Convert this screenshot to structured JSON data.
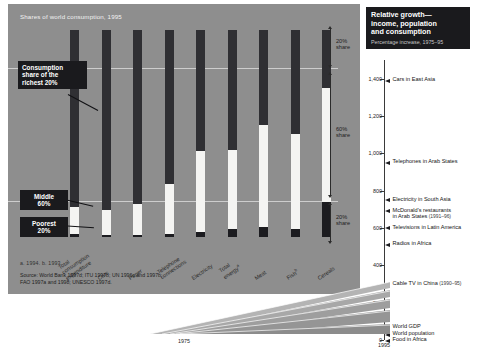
{
  "left_panel": {
    "title": "Shares of world consumption, 1995",
    "callouts": [
      {
        "id": "richest",
        "text": "Consumption\nshare of the\nrichest 20%"
      },
      {
        "id": "middle",
        "text": "Middle\n60%"
      },
      {
        "id": "poorest",
        "text": "Poorest\n20%"
      }
    ],
    "brackets": [
      {
        "label": "20%\nshare"
      },
      {
        "label": "60%\nshare"
      },
      {
        "label": "20%\nshare"
      }
    ],
    "footnote": "a. 1994.   b. 1993.",
    "source": "Source: World Bank 1997d; ITU 1997b; UN 1996c and 1997b;\nFAO 1997a and 1998; UNESCO 1997d.",
    "base_year": "1975"
  },
  "right_panel": {
    "title": "Relative growth—\nincome, population\nand consumption",
    "subtitle": "Percentage increase, 1975–95",
    "axis_ticks": [
      "1,400",
      "1,200",
      "1,000",
      "800",
      "600",
      "400",
      "200",
      "0"
    ],
    "base_year": "1995",
    "items": [
      {
        "label": "Cars in East Asia",
        "note": "",
        "value": 1400
      },
      {
        "label": "Telephones in Arab States",
        "note": "",
        "value": 960
      },
      {
        "label": "Electricity in South Asia",
        "note": "",
        "value": 760
      },
      {
        "label": "McDonald's restaurants",
        "label2": "in Arab States",
        "note": "(1991–96)",
        "value": 700
      },
      {
        "label": "Televisions in Latin America",
        "note": "",
        "value": 610
      },
      {
        "label": "Radios in Africa",
        "note": "",
        "value": 520
      },
      {
        "label": "Cable TV in China",
        "note": "(1990–95)",
        "value": 310
      },
      {
        "label": "World GDP",
        "note": "",
        "value": 75
      },
      {
        "label": "World population",
        "note": "",
        "value": 40
      },
      {
        "label": "Food in Africa",
        "note": "",
        "value": 5
      }
    ]
  },
  "chart_data": {
    "type": "bar",
    "title": "Shares of world consumption, 1995",
    "xlabel": "",
    "ylabel": "Share of world consumption (%)",
    "ylim": [
      0,
      100
    ],
    "grid": true,
    "legend_position": "right-bracket",
    "categories": [
      "Total consumption expenditure",
      "Cars",
      "Paper",
      "Telephone connections",
      "Electricity",
      "Total energy",
      "Meat",
      "Fish",
      "Cereals"
    ],
    "category_footnotes": [
      "",
      "",
      "",
      "",
      "",
      "a",
      "",
      "b",
      ""
    ],
    "series": [
      {
        "name": "Richest 20%",
        "color": "#2f2f33",
        "values": [
          86,
          87,
          84,
          74,
          58,
          58,
          45,
          45,
          28
        ]
      },
      {
        "name": "Middle 60%",
        "color": "#f4f4f2",
        "values": [
          13,
          12,
          15,
          24,
          39,
          38,
          49,
          46,
          55
        ]
      },
      {
        "name": "Poorest 20%",
        "color": "#1c1c20",
        "values": [
          1.3,
          1.1,
          1.1,
          1.5,
          2.5,
          4,
          5,
          4,
          17
        ]
      }
    ],
    "annotations": [
      "Consumption share of the richest 20%",
      "Middle 60%",
      "Poorest 20%",
      "20% share",
      "60% share",
      "20% share"
    ]
  },
  "chart_data_right": {
    "type": "bar",
    "orientation": "horizontal-markers",
    "title": "Relative growth—income, population and consumption",
    "subtitle": "Percentage increase, 1975–95",
    "xlabel": "",
    "ylabel": "Percentage increase",
    "ylim": [
      0,
      1500
    ],
    "yticks": [
      0,
      200,
      400,
      600,
      800,
      1000,
      1200,
      1400
    ],
    "categories": [
      "Cars in East Asia",
      "Telephones in Arab States",
      "Electricity in South Asia",
      "McDonald's restaurants in Arab States (1991–96)",
      "Televisions in Latin America",
      "Radios in Africa",
      "Cable TV in China (1990–95)",
      "World GDP",
      "World population",
      "Food in Africa"
    ],
    "values": [
      1400,
      960,
      760,
      700,
      610,
      520,
      310,
      75,
      40,
      5
    ]
  }
}
